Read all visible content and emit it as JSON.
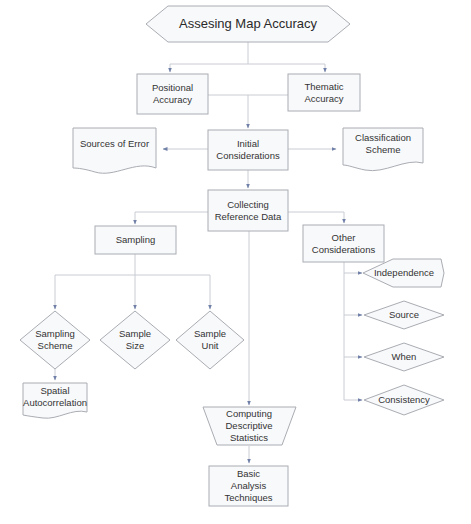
{
  "colors": {
    "background": "#ffffff",
    "shape_fill": "#f8f9fb",
    "shape_stroke": "#a9acb2",
    "connector": "#c8ccd2",
    "arrowhead": "#7080a8",
    "text": "#333333"
  },
  "title": {
    "text": "Assesing Map Accuracy",
    "shape": "hexagon"
  },
  "nodes": {
    "positional_accuracy": {
      "line1": "Positional",
      "line2": "Accuracy",
      "shape": "rectangle"
    },
    "thematic_accuracy": {
      "line1": "Thematic",
      "line2": "Accuracy",
      "shape": "rectangle"
    },
    "initial_considerations": {
      "line1": "Initial",
      "line2": "Considerations",
      "shape": "rectangle"
    },
    "sources_of_error": {
      "line1": "Sources of Error",
      "line2": "",
      "shape": "document"
    },
    "classification_scheme": {
      "line1": "Classification",
      "line2": "Scheme",
      "shape": "document"
    },
    "collecting_reference_data": {
      "line1": "Collecting",
      "line2": "Reference Data",
      "shape": "rectangle"
    },
    "sampling": {
      "line1": "Sampling",
      "line2": "",
      "shape": "rectangle"
    },
    "other_considerations": {
      "line1": "Other",
      "line2": "Considerations",
      "shape": "rectangle"
    },
    "independence": {
      "line1": "Independence",
      "shape": "diamond"
    },
    "source": {
      "line1": "Source",
      "shape": "diamond"
    },
    "when": {
      "line1": "When",
      "shape": "diamond"
    },
    "consistency": {
      "line1": "Consistency",
      "shape": "diamond"
    },
    "sampling_scheme": {
      "line1": "Sampling",
      "line2": "Scheme",
      "shape": "diamond"
    },
    "sample_size": {
      "line1": "Sample",
      "line2": "Size",
      "shape": "diamond"
    },
    "sample_unit": {
      "line1": "Sample",
      "line2": "Unit",
      "shape": "diamond"
    },
    "spatial_autocorrelation": {
      "line1": "Spatial",
      "line2": "Autocorrelation",
      "shape": "document"
    },
    "computing_descriptive_statistics": {
      "line1": "Computing",
      "line2": "Descriptive",
      "line3": "Statistics",
      "shape": "trapezoid"
    },
    "basic_analysis_techniques": {
      "line1": "Basic",
      "line2": "Analysis",
      "line3": "Techniques",
      "shape": "rectangle"
    }
  },
  "edges": [
    [
      "title",
      "positional_accuracy"
    ],
    [
      "title",
      "thematic_accuracy"
    ],
    [
      "positional_accuracy",
      "initial_considerations"
    ],
    [
      "thematic_accuracy",
      "initial_considerations"
    ],
    [
      "initial_considerations",
      "sources_of_error"
    ],
    [
      "initial_considerations",
      "classification_scheme"
    ],
    [
      "initial_considerations",
      "collecting_reference_data"
    ],
    [
      "collecting_reference_data",
      "sampling"
    ],
    [
      "collecting_reference_data",
      "other_considerations"
    ],
    [
      "collecting_reference_data",
      "computing_descriptive_statistics"
    ],
    [
      "other_considerations",
      "independence"
    ],
    [
      "other_considerations",
      "source"
    ],
    [
      "other_considerations",
      "when"
    ],
    [
      "other_considerations",
      "consistency"
    ],
    [
      "sampling",
      "sampling_scheme"
    ],
    [
      "sampling",
      "sample_size"
    ],
    [
      "sampling",
      "sample_unit"
    ],
    [
      "sampling_scheme",
      "spatial_autocorrelation"
    ],
    [
      "computing_descriptive_statistics",
      "basic_analysis_techniques"
    ]
  ]
}
